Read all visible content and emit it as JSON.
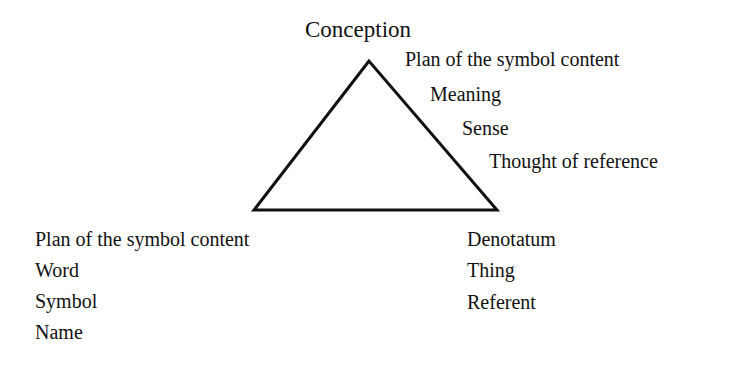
{
  "diagram": {
    "type": "semiotic-triangle",
    "apex": {
      "title": "Conception",
      "labels": [
        "Plan of the symbol content",
        "Meaning",
        "Sense",
        "Thought of reference"
      ]
    },
    "bottom_left": {
      "labels": [
        "Plan of the symbol content",
        "Word",
        "Symbol",
        "Name"
      ]
    },
    "bottom_right": {
      "labels": [
        "Denotatum",
        "Thing",
        "Referent"
      ]
    },
    "colors": {
      "line": "#111111",
      "text": "#111111",
      "background": "#ffffff"
    }
  }
}
